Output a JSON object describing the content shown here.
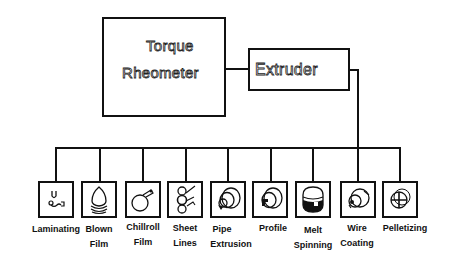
{
  "diagram": {
    "top_nodes": {
      "rheometer": {
        "line1": "Torque",
        "line2": "Rheometer"
      },
      "extruder": {
        "label": "Extruder"
      }
    },
    "processes": [
      {
        "id": "laminating",
        "line1": "Laminating",
        "line2": "",
        "icon": "laminating-icon"
      },
      {
        "id": "blown-film",
        "line1": "Blown",
        "line2": "Film",
        "icon": "blown-film-icon"
      },
      {
        "id": "chillroll-film",
        "line1": "Chillroll",
        "line2": "Film",
        "icon": "chillroll-icon"
      },
      {
        "id": "sheet-lines",
        "line1": "Sheet",
        "line2": "Lines",
        "icon": "sheet-lines-icon"
      },
      {
        "id": "pipe-extrusion",
        "line1": "Pipe",
        "line2": "Extrusion",
        "icon": "pipe-icon"
      },
      {
        "id": "profile",
        "line1": "Profile",
        "line2": "",
        "icon": "profile-icon"
      },
      {
        "id": "melt-spinning",
        "line1": "Melt",
        "line2": "Spinning",
        "icon": "melt-spinning-icon"
      },
      {
        "id": "wire-coating",
        "line1": "Wire",
        "line2": "Coating",
        "icon": "wire-coating-icon"
      },
      {
        "id": "pelletizing",
        "line1": "Pelletizing",
        "line2": "",
        "icon": "pelletizing-icon"
      }
    ],
    "edges": [
      [
        "Torque Rheometer",
        "Extruder"
      ],
      [
        "Extruder",
        "Laminating"
      ],
      [
        "Extruder",
        "Blown Film"
      ],
      [
        "Extruder",
        "Chillroll Film"
      ],
      [
        "Extruder",
        "Sheet Lines"
      ],
      [
        "Extruder",
        "Pipe Extrusion"
      ],
      [
        "Extruder",
        "Profile"
      ],
      [
        "Extruder",
        "Melt Spinning"
      ],
      [
        "Extruder",
        "Wire Coating"
      ],
      [
        "Extruder",
        "Pelletizing"
      ]
    ]
  }
}
